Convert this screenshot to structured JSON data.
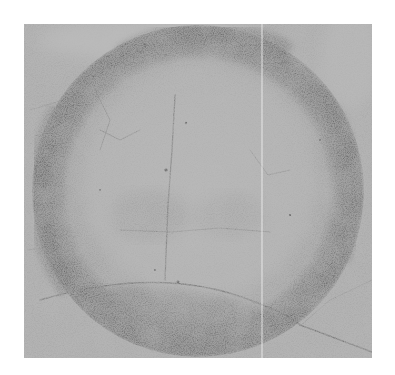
{
  "image": {
    "description": "Grayscale photograph of a weathered, cracked surface with a large dark circular ring",
    "alt": "Circular dark ring on textured gray surface"
  },
  "colors": {
    "background": "#ffffff",
    "surface": "#a6a6a6",
    "surface_light": "#bdbdbd",
    "ring": "#6e6e6e",
    "ring_dark": "#555555",
    "inner_disc": "#acacac",
    "crack": "#5a5a5a",
    "scratch_line": "#f2f2f2"
  },
  "geometry": {
    "photo_frame": {
      "x": 24,
      "y": 24,
      "width": 348,
      "height": 334
    },
    "circle": {
      "cx": 198,
      "cy": 191,
      "r": 166
    },
    "ring_thickness": 30,
    "vertical_scratch_x": 262
  }
}
